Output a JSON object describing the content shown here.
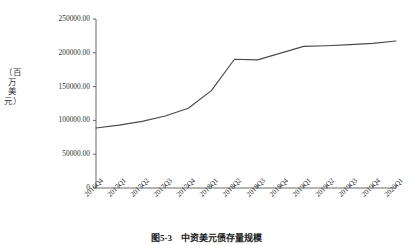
{
  "figure": {
    "caption": "图5-3　中资美元债存量规模",
    "y_axis_unit_label": "（百万美元）"
  },
  "chart_data": {
    "type": "line",
    "title": "",
    "xlabel": "",
    "ylabel": "（百万美元）",
    "ylim": [
      0,
      250000
    ],
    "ytick_labels": [
      "0",
      "50000.00",
      "100000.00",
      "150000.00",
      "200000.00",
      "250000.00"
    ],
    "ytick_values": [
      0,
      50000,
      100000,
      150000,
      200000,
      250000
    ],
    "grid": false,
    "legend": "none",
    "line_color": "#4a4a4a",
    "categories": [
      "2016Q4",
      "2017Q1",
      "2017Q2",
      "2017Q3",
      "2017Q4",
      "2018Q1",
      "2018Q2",
      "2018Q3",
      "2018Q4",
      "2019Q1",
      "2019Q2",
      "2019Q3",
      "2019Q4",
      "2020Q1"
    ],
    "values": [
      88700,
      93000,
      98500,
      106500,
      118000,
      144000,
      190500,
      189500,
      199500,
      209500,
      210500,
      212000,
      214000,
      217500
    ]
  }
}
